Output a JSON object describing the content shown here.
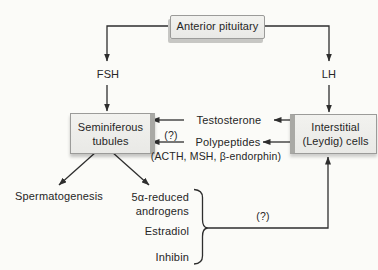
{
  "palette": {
    "background": "#fbfbf8",
    "box_fill": "#ebebe8",
    "box_border": "#9b9b99",
    "box_side_shade": "#a9a9a5",
    "box_drop_shadow": "#c7c7c4",
    "line": "#2e2e2e",
    "text": "#262626"
  },
  "nodes": {
    "anterior_pituitary": "Anterior pituitary",
    "seminiferous_tubules": "Seminiferous\ntubules",
    "interstitial_cells": "Interstitial\n(Leydig) cells"
  },
  "labels": {
    "fsh": "FSH",
    "lh": "LH",
    "testosterone": "Testosterone",
    "question_inner": "(?)",
    "polypeptides": "Polypeptides",
    "polypeptides_detail": "(ACTH, MSH, β-endorphin)",
    "spermatogenesis": "Spermatogenesis",
    "reduced_androgens": "5α-reduced\nandrogens",
    "estradiol": "Estradiol",
    "inhibin": "Inhibin",
    "question_feedback": "(?)"
  }
}
